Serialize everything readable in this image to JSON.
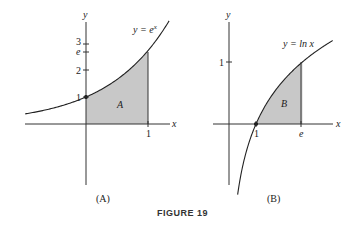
{
  "figure": {
    "caption": "FIGURE 19",
    "panels": [
      {
        "id": "A",
        "sublabel": "(A)",
        "curve_label": "y = e",
        "curve_label_exp": "x",
        "region_label": "A",
        "x_axis_label": "x",
        "y_axis_label": "y",
        "x_ticks": [
          "1"
        ],
        "y_ticks": [
          "1",
          "2",
          "e",
          "3"
        ],
        "marked_point": "(0, 1)",
        "shaded_interval": [
          0,
          1
        ]
      },
      {
        "id": "B",
        "sublabel": "(B)",
        "curve_label": "y = ln x",
        "region_label": "B",
        "x_axis_label": "x",
        "y_axis_label": "y",
        "x_ticks": [
          "1",
          "e"
        ],
        "y_ticks": [
          "1"
        ],
        "marked_point": "(1, 0)",
        "shaded_interval": [
          1,
          "e"
        ]
      }
    ],
    "colors": {
      "shade": "#c8c8c8",
      "curve": "#222222",
      "axis": "#333333"
    }
  }
}
